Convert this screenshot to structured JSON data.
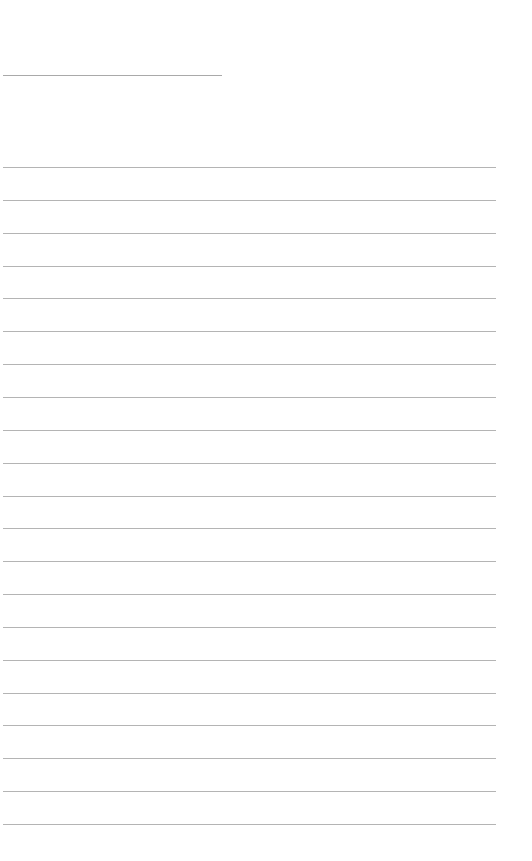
{
  "page": {
    "type": "blank lined writing sheet",
    "background_color": "#ffffff",
    "line_color": "#b4b4b4",
    "header_line": {
      "label": "",
      "value": ""
    },
    "ruled_lines": {
      "count": 21,
      "first_y": 167,
      "spacing": 32.85,
      "entries": [
        "",
        "",
        "",
        "",
        "",
        "",
        "",
        "",
        "",
        "",
        "",
        "",
        "",
        "",
        "",
        "",
        "",
        "",
        "",
        "",
        ""
      ]
    }
  }
}
